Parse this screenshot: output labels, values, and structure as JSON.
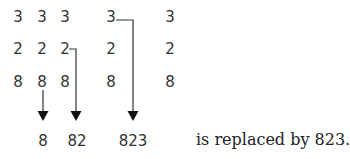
{
  "diagram": {
    "columns": [
      [
        "3",
        "2",
        "8"
      ],
      [
        "3",
        "2",
        "8"
      ],
      [
        "3",
        "2",
        "8"
      ],
      [
        "3",
        "2",
        "8"
      ],
      [
        "3",
        "2",
        "8"
      ]
    ],
    "results": [
      "8",
      "82",
      "823"
    ],
    "caption": "is replaced by 823.",
    "colors": {
      "text": "#333333",
      "line": "#333333"
    }
  }
}
